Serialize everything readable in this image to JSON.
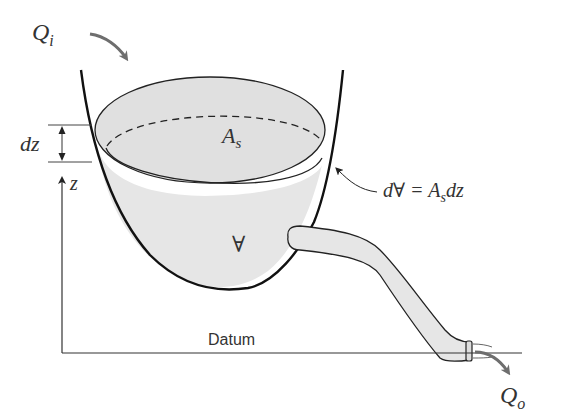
{
  "diagram": {
    "type": "reservoir-storage-schematic",
    "labels": {
      "inflow": "Q",
      "inflow_sub": "i",
      "outflow": "Q",
      "outflow_sub": "o",
      "surface_area": "A",
      "surface_area_sub": "s",
      "volume": "∀",
      "height_increment": "dz",
      "vertical_axis": "z",
      "datum": "Datum",
      "equation_lhs": "d∀ = ",
      "equation_A": "A",
      "equation_sub": "s",
      "equation_dz": "dz"
    },
    "colors": {
      "outline": "#111111",
      "water_fill": "#e6e6e6",
      "arrow_gray": "#6e6e6e",
      "text": "#333333"
    }
  }
}
